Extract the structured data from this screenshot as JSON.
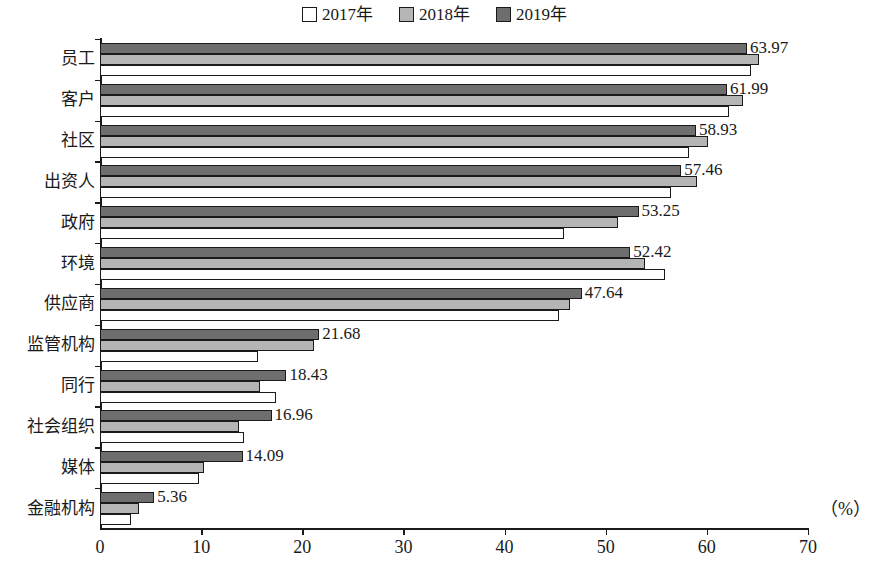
{
  "chart_data": {
    "type": "bar",
    "orientation": "horizontal",
    "title": "",
    "xlabel": "(%)",
    "ylabel": "",
    "xlim": [
      0,
      70
    ],
    "xticks": [
      0,
      10,
      20,
      30,
      40,
      50,
      60,
      70
    ],
    "grid": false,
    "legend_position": "top-center",
    "categories": [
      "员工",
      "客户",
      "社区",
      "出资人",
      "政府",
      "环境",
      "供应商",
      "监管机构",
      "同行",
      "社会组织",
      "媒体",
      "金融机构"
    ],
    "series": [
      {
        "name": "2017年",
        "color": "#ffffff",
        "values": [
          64.4,
          62.2,
          58.2,
          56.5,
          45.9,
          55.9,
          45.4,
          15.6,
          17.4,
          14.2,
          9.8,
          3.1
        ]
      },
      {
        "name": "2018年",
        "color": "#b5b5b5",
        "values": [
          65.2,
          63.6,
          60.1,
          59.0,
          51.2,
          53.9,
          46.5,
          21.2,
          15.8,
          13.7,
          10.3,
          3.9
        ]
      },
      {
        "name": "2019年",
        "color": "#6e6e6e",
        "values": [
          63.97,
          61.99,
          58.93,
          57.46,
          53.25,
          52.42,
          47.64,
          21.68,
          18.43,
          16.96,
          14.09,
          5.36
        ]
      }
    ],
    "data_labels": {
      "series": "2019年",
      "values": [
        "63.97",
        "61.99",
        "58.93",
        "57.46",
        "53.25",
        "52.42",
        "47.64",
        "21.68",
        "18.43",
        "16.96",
        "14.09",
        "5.36"
      ]
    }
  },
  "legend": {
    "items": [
      {
        "label": "2017年",
        "swatch": "white-square-icon"
      },
      {
        "label": "2018年",
        "swatch": "light-gray-square-icon"
      },
      {
        "label": "2019年",
        "swatch": "dark-gray-square-icon"
      }
    ]
  },
  "axis": {
    "x_tick_labels": [
      "0",
      "10",
      "20",
      "30",
      "40",
      "50",
      "60",
      "70"
    ],
    "x_unit": "（%）"
  }
}
